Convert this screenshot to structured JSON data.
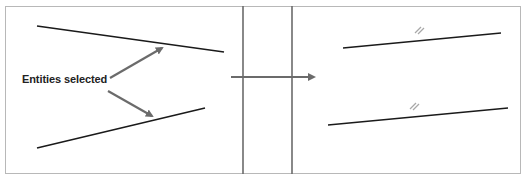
{
  "diagram": {
    "label": "Entities selected",
    "colors": {
      "line": "#1a1a1a",
      "arrow": "#6b6b6b",
      "divider": "#6b6b6b",
      "border": "#b8b8b8",
      "constraint_mark": "#a8a8a8"
    },
    "before_panel": {
      "lines": [
        {
          "x1": 37,
          "y1": 26,
          "x2": 224,
          "y2": 52
        },
        {
          "x1": 37,
          "y1": 148,
          "x2": 205,
          "y2": 108
        }
      ],
      "arrows": [
        {
          "x1": 110,
          "y1": 78,
          "x2": 164,
          "y2": 47
        },
        {
          "x1": 108,
          "y1": 91,
          "x2": 154,
          "y2": 117
        }
      ]
    },
    "transition": {
      "dividers": [
        {
          "x": 243
        },
        {
          "x": 292
        }
      ],
      "arrow": {
        "x1": 231,
        "y1": 77,
        "x2": 316,
        "y2": 77
      }
    },
    "after_panel": {
      "lines": [
        {
          "x1": 343,
          "y1": 48,
          "x2": 501,
          "y2": 33
        },
        {
          "x1": 328,
          "y1": 125,
          "x2": 508,
          "y2": 108
        }
      ],
      "parallel_marks": [
        {
          "x": 418,
          "y": 30,
          "symbol": "//"
        },
        {
          "x": 414,
          "y": 105,
          "symbol": "//"
        }
      ]
    }
  }
}
